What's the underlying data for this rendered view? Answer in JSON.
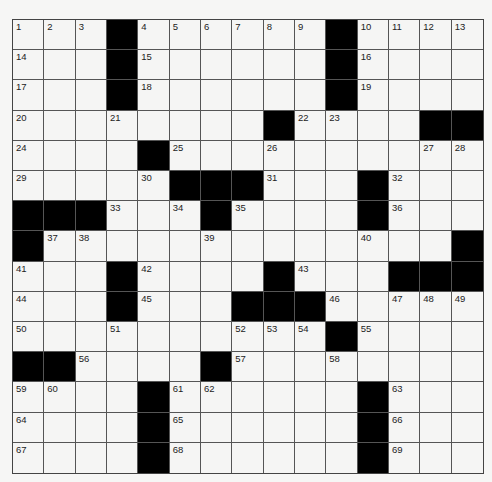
{
  "puzzle": {
    "rows": 15,
    "cols": 15,
    "grid": [
      "...#......#....",
      "...#......#....",
      "...#......#....",
      "........#....##",
      "....#..........",
      ".....###...#...",
      "###...#....#...",
      "#.............#",
      "...#....#...###",
      "...#...###.....",
      "..........#....",
      "##....#........",
      "....#......#...",
      "....#......#...",
      "....#......#..."
    ],
    "numbers": [
      [
        0,
        0,
        1
      ],
      [
        0,
        1,
        2
      ],
      [
        0,
        2,
        3
      ],
      [
        0,
        4,
        4
      ],
      [
        0,
        5,
        5
      ],
      [
        0,
        6,
        6
      ],
      [
        0,
        7,
        7
      ],
      [
        0,
        8,
        8
      ],
      [
        0,
        9,
        9
      ],
      [
        0,
        11,
        10
      ],
      [
        0,
        12,
        11
      ],
      [
        0,
        13,
        12
      ],
      [
        0,
        14,
        13
      ],
      [
        1,
        0,
        14
      ],
      [
        1,
        4,
        15
      ],
      [
        1,
        11,
        16
      ],
      [
        2,
        0,
        17
      ],
      [
        2,
        4,
        18
      ],
      [
        2,
        11,
        19
      ],
      [
        3,
        0,
        20
      ],
      [
        3,
        3,
        21
      ],
      [
        3,
        9,
        22
      ],
      [
        3,
        10,
        23
      ],
      [
        4,
        0,
        24
      ],
      [
        4,
        5,
        25
      ],
      [
        4,
        8,
        26
      ],
      [
        4,
        13,
        27
      ],
      [
        4,
        14,
        28
      ],
      [
        5,
        0,
        29
      ],
      [
        5,
        4,
        30
      ],
      [
        5,
        8,
        31
      ],
      [
        5,
        12,
        32
      ],
      [
        6,
        3,
        33
      ],
      [
        6,
        5,
        34
      ],
      [
        6,
        7,
        35
      ],
      [
        6,
        12,
        36
      ],
      [
        7,
        1,
        37
      ],
      [
        7,
        2,
        38
      ],
      [
        7,
        6,
        39
      ],
      [
        7,
        11,
        40
      ],
      [
        8,
        0,
        41
      ],
      [
        8,
        4,
        42
      ],
      [
        8,
        9,
        43
      ],
      [
        9,
        0,
        44
      ],
      [
        9,
        4,
        45
      ],
      [
        9,
        10,
        46
      ],
      [
        9,
        12,
        47
      ],
      [
        9,
        13,
        48
      ],
      [
        9,
        14,
        49
      ],
      [
        10,
        0,
        50
      ],
      [
        10,
        3,
        51
      ],
      [
        10,
        7,
        52
      ],
      [
        10,
        8,
        53
      ],
      [
        10,
        9,
        54
      ],
      [
        10,
        11,
        55
      ],
      [
        11,
        2,
        56
      ],
      [
        11,
        7,
        57
      ],
      [
        11,
        10,
        58
      ],
      [
        12,
        0,
        59
      ],
      [
        12,
        1,
        60
      ],
      [
        12,
        5,
        61
      ],
      [
        12,
        6,
        62
      ],
      [
        12,
        12,
        63
      ],
      [
        13,
        0,
        64
      ],
      [
        13,
        5,
        65
      ],
      [
        13,
        12,
        66
      ],
      [
        14,
        0,
        67
      ],
      [
        14,
        5,
        68
      ],
      [
        14,
        12,
        69
      ]
    ],
    "colors": {
      "block": "#000000",
      "cell": "#f5f5f4",
      "line": "#555555",
      "number": "#222222"
    }
  }
}
